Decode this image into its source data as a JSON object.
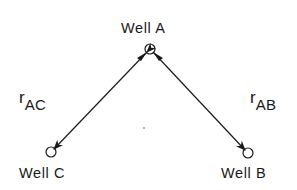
{
  "diagram": {
    "type": "well-network",
    "wells": [
      {
        "id": "A",
        "label": "Well A",
        "x": 150,
        "y": 49
      },
      {
        "id": "B",
        "label": "Well B",
        "x": 248,
        "y": 153
      },
      {
        "id": "C",
        "label": "Well C",
        "x": 51,
        "y": 152
      }
    ],
    "connections": [
      {
        "from": "A",
        "to": "C",
        "label_main": "r",
        "label_sub": "AC",
        "bidirectional": true
      },
      {
        "from": "A",
        "to": "B",
        "label_main": "r",
        "label_sub": "AB",
        "bidirectional": true
      }
    ],
    "colors": {
      "line": "#1a1a1a",
      "background": "#ffffff"
    }
  }
}
